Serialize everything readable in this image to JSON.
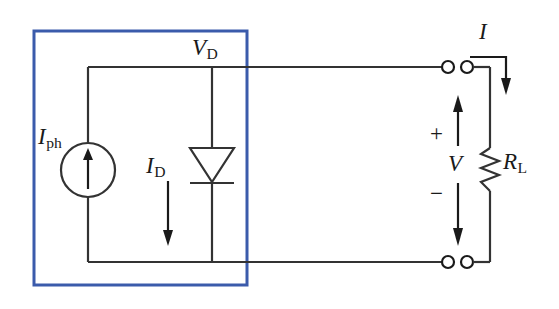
{
  "figure": {
    "kind": "circuit-diagram",
    "background_color": "#ffffff",
    "wire_color": "#333333",
    "highlight_box_color": "#3b5bab"
  },
  "labels": {
    "photocurrent_source": {
      "symbol": "I",
      "subscript": "ph"
    },
    "diode_current": {
      "symbol": "I",
      "subscript": "D"
    },
    "diode_voltage": {
      "symbol": "V",
      "subscript": "D"
    },
    "output_current": {
      "symbol": "I",
      "subscript": ""
    },
    "output_voltage": {
      "symbol": "V",
      "subscript": ""
    },
    "load_resistor": {
      "symbol": "R",
      "subscript": "L"
    },
    "polarity_positive": "+",
    "polarity_negative": "−"
  },
  "components": {
    "current_source": {
      "name": "photocurrent-source",
      "shape": "circle-with-up-arrow"
    },
    "diode": {
      "name": "diode",
      "shape": "triangle-with-cathode-bar",
      "orientation": "cathode-down"
    },
    "resistor": {
      "name": "load-resistor",
      "shape": "zigzag",
      "orientation": "vertical"
    },
    "terminals": {
      "name": "output-terminals",
      "shape": "open-circle",
      "count": 4
    },
    "highlight_box": {
      "name": "solar-cell-boundary",
      "style": "blue-rectangle"
    }
  },
  "arrows": {
    "photocurrent_direction": "up",
    "diode_current_direction": "down",
    "output_current_direction": "down",
    "output_voltage_direction": "up"
  }
}
